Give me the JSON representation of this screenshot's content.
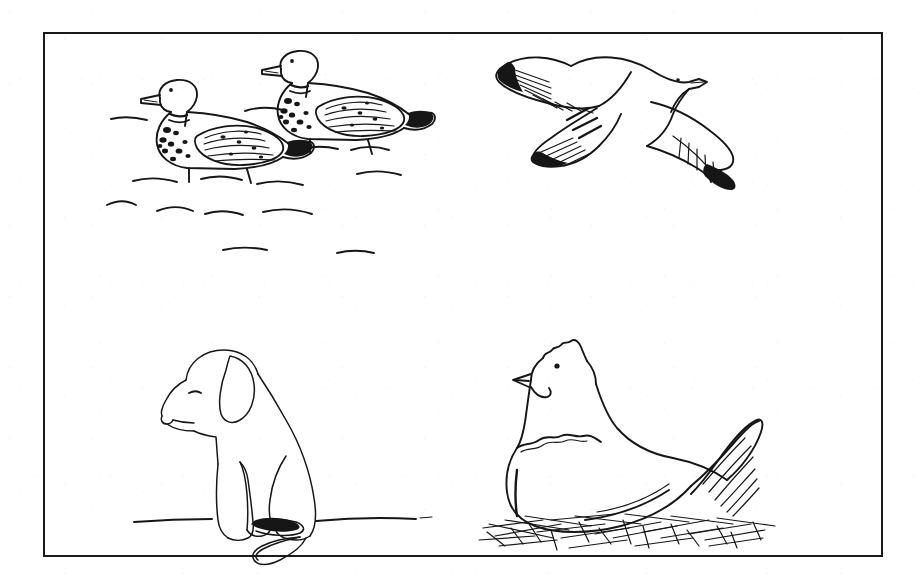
{
  "document": {
    "kind": "illustration-plate",
    "medium": "black and white pen line drawing",
    "background_color": "#ffffff",
    "ink_color": "#161616",
    "frame": {
      "style": "single rectangular rule",
      "border_color": "#1a1a1a",
      "border_width_px": 2.5,
      "x": 43,
      "y": 32,
      "width": 840,
      "height": 525
    }
  },
  "panels": [
    {
      "id": "ducks",
      "name": "two-ducks-swimming",
      "position": "top-left",
      "subject": "Two ducks swimming on water",
      "subject_count": 2,
      "elements": [
        "duck-front",
        "duck-rear",
        "water-ripples"
      ],
      "details": {
        "duck_markings": "dark speckled breast and neck ring, hatched wing feathers, dark tail",
        "water": "short horizontal wavy ripple strokes",
        "ripple_count": 14
      }
    },
    {
      "id": "gull",
      "name": "seagull-in-flight",
      "position": "top-right",
      "subject": "Seagull gliding with wings outstretched",
      "subject_count": 1,
      "elements": [
        "gull-body",
        "gull-head",
        "gull-upper-wing",
        "gull-lower-wing",
        "gull-eye"
      ],
      "details": {
        "wingtips": "dark hatched primary feathers at both wing tips",
        "orientation": "facing right, viewed from above-side"
      }
    },
    {
      "id": "dog",
      "name": "sitting-dog",
      "position": "bottom-left",
      "subject": "Dog sitting in profile facing left",
      "subject_count": 1,
      "elements": [
        "dog-head",
        "dog-ear",
        "dog-eye",
        "dog-muzzle",
        "dog-body",
        "dog-foreleg",
        "dog-hind-leg",
        "dog-paw",
        "dog-tail",
        "ground-line"
      ],
      "details": {
        "breed_look": "floppy-eared hound / labrador puppy",
        "ground": "single thin horizontal ground line"
      }
    },
    {
      "id": "hen",
      "name": "hen-on-nest",
      "position": "bottom-right",
      "subject": "Hen sitting on a nest of straw",
      "subject_count": 1,
      "elements": [
        "hen-comb",
        "hen-eye",
        "hen-beak",
        "hen-wattle",
        "hen-neck-hackles",
        "hen-body",
        "hen-tail-feathers",
        "straw-nest"
      ],
      "details": {
        "tail": "long curved hatched tail feathers sweeping up and right",
        "nest": "crosshatched scattered straw strokes"
      }
    }
  ],
  "icons": {
    "duck": "duck-icon",
    "gull": "bird-icon",
    "dog": "dog-icon",
    "hen": "hen-icon"
  }
}
